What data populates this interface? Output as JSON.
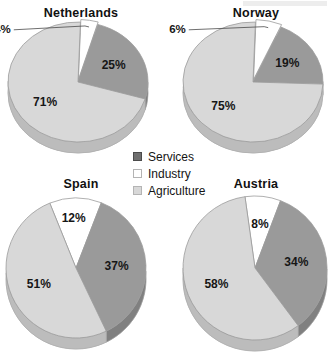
{
  "figure": {
    "background": "#ffffff"
  },
  "legend": {
    "name": "sector-legend",
    "position": "center",
    "items": [
      {
        "label": "Services",
        "color": "#6f6f6f",
        "swatch_border": "#4b4b4b"
      },
      {
        "label": "Industry",
        "color": "#ffffff",
        "swatch_border": "#b4b4b4"
      },
      {
        "label": "Agriculture",
        "color": "#d8d8d8",
        "swatch_border": "#b4b4b4"
      }
    ]
  },
  "chart_data": {
    "type": "pie",
    "title": "",
    "categories": [
      "Services",
      "Industry",
      "Agriculture"
    ],
    "colors": {
      "Services": "#9a9a9a",
      "Industry": "#ffffff",
      "Agriculture": "#d8d8d8"
    },
    "charts": [
      {
        "title": "Netherlands",
        "slices": [
          {
            "name": "Industry",
            "value": 4,
            "label": "4%",
            "label_placement": "outside"
          },
          {
            "name": "Services",
            "value": 25,
            "label": "25%",
            "label_placement": "inside"
          },
          {
            "name": "Agriculture",
            "value": 71,
            "label": "71%",
            "label_placement": "inside"
          }
        ]
      },
      {
        "title": "Norway",
        "slices": [
          {
            "name": "Industry",
            "value": 6,
            "label": "6%",
            "label_placement": "outside"
          },
          {
            "name": "Services",
            "value": 19,
            "label": "19%",
            "label_placement": "inside"
          },
          {
            "name": "Agriculture",
            "value": 75,
            "label": "75%",
            "label_placement": "inside"
          }
        ]
      },
      {
        "title": "Spain",
        "slices": [
          {
            "name": "Industry",
            "value": 12,
            "label": "12%",
            "label_placement": "edge"
          },
          {
            "name": "Services",
            "value": 37,
            "label": "37%",
            "label_placement": "inside"
          },
          {
            "name": "Agriculture",
            "value": 51,
            "label": "51%",
            "label_placement": "inside"
          }
        ]
      },
      {
        "title": "Austria",
        "slices": [
          {
            "name": "Industry",
            "value": 8,
            "label": "8%",
            "label_placement": "inside"
          },
          {
            "name": "Services",
            "value": 34,
            "label": "34%",
            "label_placement": "inside"
          },
          {
            "name": "Agriculture",
            "value": 58,
            "label": "58%",
            "label_placement": "inside"
          }
        ]
      }
    ]
  }
}
